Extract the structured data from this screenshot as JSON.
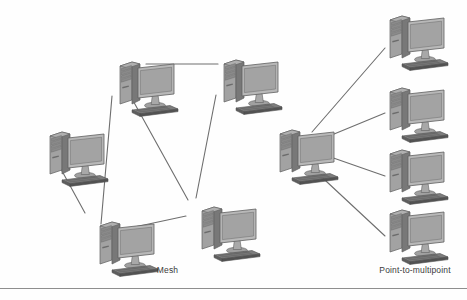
{
  "figure": {
    "background_color": "#fefefe",
    "line_color": "#6e6e6e",
    "rule_color": "#8e8e8e"
  },
  "captions": {
    "mesh": "Mesh",
    "point_to_multipoint": "Point-to-multipoint",
    "text_color": "#3a3a3a"
  },
  "icon_colors": {
    "tower_front": "#8d8d8d",
    "tower_side": "#6d6d6d",
    "tower_top": "#a8a8a8",
    "monitor_bezel": "#b4b4b4",
    "monitor_screen": "#a3a3a3",
    "monitor_stand": "#9a9a9a",
    "keyboard": "#5a5a5a",
    "keyboard_top": "#7d7d7d",
    "outline": "#5f5f5f"
  },
  "diagrams": [
    {
      "id": "mesh",
      "name": "Mesh topology",
      "label": "Mesh",
      "nodes": [
        {
          "id": "mesh-top-left",
          "name": "computer-mesh-top-left",
          "x": 118,
          "y": 60,
          "scale": 1.0
        },
        {
          "id": "mesh-top-right",
          "name": "computer-mesh-top-right",
          "x": 222,
          "y": 58,
          "scale": 1.0
        },
        {
          "id": "mesh-left",
          "name": "computer-mesh-left",
          "x": 48,
          "y": 130,
          "scale": 1.0
        },
        {
          "id": "mesh-bottom-left",
          "name": "computer-mesh-bottom-left",
          "x": 98,
          "y": 220,
          "scale": 1.0
        },
        {
          "id": "mesh-bottom-right",
          "name": "computer-mesh-bottom-right",
          "x": 200,
          "y": 205,
          "scale": 1.0
        }
      ],
      "links": [
        {
          "from": "mesh-top-left",
          "to": "mesh-top-right",
          "x1": 146,
          "y1": 64,
          "x2": 218,
          "y2": 64
        },
        {
          "from": "mesh-top-left",
          "to": "mesh-bottom-left",
          "x1": 112,
          "y1": 96,
          "x2": 101,
          "y2": 224
        },
        {
          "from": "mesh-top-left",
          "to": "mesh-bottom-right",
          "x1": 131,
          "y1": 97,
          "x2": 188,
          "y2": 200
        },
        {
          "from": "mesh-top-right",
          "to": "mesh-bottom-right",
          "x1": 216,
          "y1": 95,
          "x2": 196,
          "y2": 198
        },
        {
          "from": "mesh-left",
          "to": "mesh-bottom-left",
          "x1": 56,
          "y1": 160,
          "x2": 85,
          "y2": 213
        },
        {
          "from": "mesh-bottom-left",
          "to": "mesh-bottom-right",
          "x1": 130,
          "y1": 228,
          "x2": 186,
          "y2": 216
        }
      ]
    },
    {
      "id": "point-to-multipoint",
      "name": "Point-to-multipoint topology",
      "label": "Point-to-multipoint",
      "nodes": [
        {
          "id": "ptmp-hub",
          "name": "computer-ptmp-hub",
          "x": 278,
          "y": 128,
          "scale": 1.0
        },
        {
          "id": "ptmp-spoke-1",
          "name": "computer-ptmp-spoke-1",
          "x": 388,
          "y": 14,
          "scale": 1.0
        },
        {
          "id": "ptmp-spoke-2",
          "name": "computer-ptmp-spoke-2",
          "x": 388,
          "y": 86,
          "scale": 1.0
        },
        {
          "id": "ptmp-spoke-3",
          "name": "computer-ptmp-spoke-3",
          "x": 388,
          "y": 148,
          "scale": 1.0
        },
        {
          "id": "ptmp-spoke-4",
          "name": "computer-ptmp-spoke-4",
          "x": 388,
          "y": 208,
          "scale": 1.0
        }
      ],
      "links": [
        {
          "from": "ptmp-hub",
          "to": "ptmp-spoke-1",
          "x1": 312,
          "y1": 132,
          "x2": 385,
          "y2": 48
        },
        {
          "from": "ptmp-hub",
          "to": "ptmp-spoke-2",
          "x1": 322,
          "y1": 139,
          "x2": 385,
          "y2": 113
        },
        {
          "from": "ptmp-hub",
          "to": "ptmp-spoke-3",
          "x1": 322,
          "y1": 154,
          "x2": 385,
          "y2": 176
        },
        {
          "from": "ptmp-hub",
          "to": "ptmp-spoke-4",
          "x1": 312,
          "y1": 168,
          "x2": 385,
          "y2": 236
        }
      ]
    }
  ]
}
